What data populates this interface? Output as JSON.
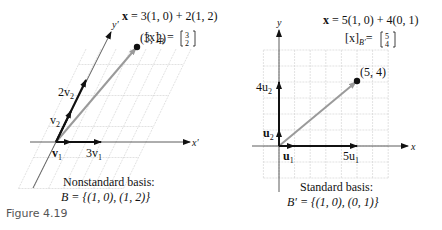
{
  "caption": "Figure 4.19",
  "left": {
    "equation": "x = 3(1, 0) + 2(1, 2)",
    "eq_bold": "x",
    "eq_rest": " = 3(1, 0) + 2(1, 2)",
    "coord_label": "[x]",
    "coord_sub": "B",
    "coord_vec": [
      "3",
      "2"
    ],
    "point": [
      3,
      2
    ],
    "point_label": "(3, 2)",
    "x_axis_label": "x′",
    "y_axis_label": "y′",
    "labels": {
      "v1": "v",
      "v1_sub": "1",
      "three_v1": "3v",
      "v2": "v",
      "v2_sub": "2",
      "two_v2": "2v"
    },
    "basis_title": "Nonstandard basis:",
    "basis_set": "B = {(1, 0), (1, 2)}",
    "basis": [
      [
        1,
        0
      ],
      [
        1,
        2
      ]
    ],
    "vector_color": "#9a9a9a",
    "grid_color": "#cfcfcf"
  },
  "right": {
    "eq_bold": "x",
    "eq_rest": " = 5(1, 0) + 4(0, 1)",
    "coord_label": "[x]",
    "coord_sub": "B′",
    "coord_vec": [
      "5",
      "4"
    ],
    "point": [
      5,
      4
    ],
    "point_label": "(5, 4)",
    "x_axis_label": "x",
    "y_axis_label": "y",
    "labels": {
      "u1": "u",
      "u1_sub": "1",
      "five_u1": "5u",
      "u2": "u",
      "u2_sub": "2",
      "four_u2": "4u"
    },
    "basis_title": "Standard basis:",
    "basis_set": "B′ = {(1, 0), (0, 1)}",
    "basis": [
      [
        1,
        0
      ],
      [
        0,
        1
      ]
    ],
    "vector_color": "#9a9a9a",
    "grid_color": "#cfcfcf"
  }
}
